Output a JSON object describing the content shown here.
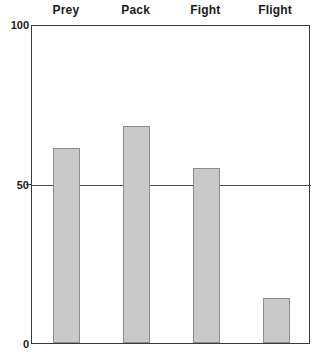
{
  "chart_data": {
    "type": "bar",
    "title": "",
    "subtitle": "",
    "xlabel": "",
    "ylabel": "",
    "categories": [
      "Prey",
      "Pack",
      "Fight",
      "Flight"
    ],
    "values": [
      61,
      68,
      55,
      14
    ],
    "series": [
      {
        "name": "",
        "values": [
          61,
          68,
          55,
          14
        ]
      }
    ],
    "ylim": [
      0,
      100
    ],
    "y_ticks": [
      0,
      50,
      100
    ],
    "y_tick_labels": [
      "0",
      "50",
      "100"
    ],
    "x_tick_labels": [
      "Prey",
      "Pack",
      "Fight",
      "Flight"
    ],
    "x_labels_position": "top",
    "grid": true,
    "gridlines_y": [
      50
    ],
    "legend": false,
    "legend_position": "none",
    "bar_color": "#c9c9c9",
    "bar_border_color": "#8d8d8d",
    "axis_color": "#3a3a3a",
    "text_color": "#1a1a1a",
    "background_color": "#ffffff",
    "annotations": []
  },
  "axis": {
    "y_top_label": "100",
    "y_mid_label": "50",
    "y_bottom_label": "0"
  }
}
